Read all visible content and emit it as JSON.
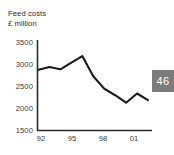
{
  "figure": {
    "title_lines": [
      "Feed costs",
      "£ million"
    ],
    "page_number_badge": "46",
    "badge_color": "#7b7b7b",
    "line_color": "#1a1a1a",
    "axis_color": "#2b2b2b"
  },
  "chart_data": {
    "type": "line",
    "title": "Feed costs",
    "subtitle": "£ million",
    "xlabel": "",
    "ylabel": "£ million",
    "ylim": [
      1500,
      3500
    ],
    "yticks": [
      1500,
      2000,
      2500,
      3000,
      3500
    ],
    "xticks": [
      "92",
      "95",
      "98",
      "01"
    ],
    "xtick_years": [
      1992,
      1995,
      1998,
      2001
    ],
    "x": [
      1992,
      1993,
      1994,
      1995,
      1996,
      1997,
      1998,
      1999,
      2000,
      2001,
      2002
    ],
    "categories": [
      "92",
      "93",
      "94",
      "95",
      "96",
      "97",
      "98",
      "99",
      "00",
      "01",
      "02"
    ],
    "values": [
      2870,
      2930,
      2880,
      3030,
      3180,
      2720,
      2440,
      2290,
      2120,
      2330,
      2180
    ],
    "series": [
      {
        "name": "Feed costs",
        "values": [
          2870,
          2930,
          2880,
          3030,
          3180,
          2720,
          2440,
          2290,
          2120,
          2330,
          2180
        ]
      }
    ],
    "grid": false,
    "legend": "none",
    "units": "£ million"
  }
}
